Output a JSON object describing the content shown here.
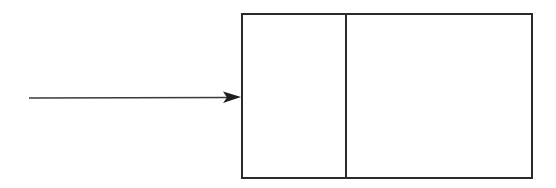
{
  "diagram": {
    "type": "pointer-to-node",
    "stroke_color": "#2a2a2a",
    "background": "#ffffff",
    "arrow": {
      "x1": 29,
      "y1": 98,
      "x2": 241,
      "y2": 97,
      "head": "filled-triangle"
    },
    "node": {
      "x": 242,
      "y": 14,
      "width": 290,
      "height": 164,
      "cells": [
        {
          "name": "left-field",
          "label": ""
        },
        {
          "name": "right-field",
          "label": ""
        }
      ],
      "divider_x": 346
    }
  }
}
